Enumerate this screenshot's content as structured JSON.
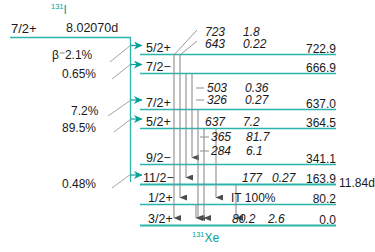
{
  "diagram": {
    "type": "nuclear-decay-scheme",
    "parent": {
      "isotope_mass": "131",
      "isotope_symbol": "I",
      "spin_parity": "7/2+",
      "half_life": "8.02070d"
    },
    "daughter": {
      "isotope_mass": "131",
      "isotope_symbol": "Xe"
    },
    "isomer_note": "11.84d",
    "colors": {
      "level_line": "#2bb5ab",
      "beta_arrow": "#00a39a",
      "gamma_arrow": "#5a5a5a",
      "text": "#1a1a1a",
      "isotope_text": "#00a39a",
      "background": "#ffffff"
    },
    "beta_branches": [
      {
        "label": "β⁻2.1%",
        "feeds_energy": "722.9"
      },
      {
        "label": "0.65%",
        "feeds_energy": "666.9"
      },
      {
        "label": "7.2%",
        "feeds_energy": "637.0"
      },
      {
        "label": "89.5%",
        "feeds_energy": "364.5"
      },
      {
        "label": "0.48%",
        "feeds_energy": "163.9"
      }
    ],
    "levels": [
      {
        "spin_parity": "5/2+",
        "energy": "722.9"
      },
      {
        "spin_parity": "7/2−",
        "energy": "666.9"
      },
      {
        "spin_parity": "7/2+",
        "energy": "637.0"
      },
      {
        "spin_parity": "5/2+",
        "energy": "364.5"
      },
      {
        "spin_parity": "9/2−",
        "energy": "341.1"
      },
      {
        "spin_parity": "11/2−",
        "energy": "163.9"
      },
      {
        "spin_parity": "1/2+",
        "energy": "80.2"
      },
      {
        "spin_parity": "3/2+",
        "energy": "0.0"
      }
    ],
    "transitions": [
      {
        "energy": "723",
        "intensity": "1.8"
      },
      {
        "energy": "643",
        "intensity": "0.22"
      },
      {
        "energy": "503",
        "intensity": "0.36"
      },
      {
        "energy": "326",
        "intensity": "0.27"
      },
      {
        "energy": "637",
        "intensity": "7.2"
      },
      {
        "energy": "365",
        "intensity": "81.7"
      },
      {
        "energy": "284",
        "intensity": "6.1"
      },
      {
        "energy": "177",
        "intensity": "0.27"
      },
      {
        "energy": "80.2",
        "intensity": "2.6"
      }
    ],
    "it_label": "IT 100%"
  }
}
